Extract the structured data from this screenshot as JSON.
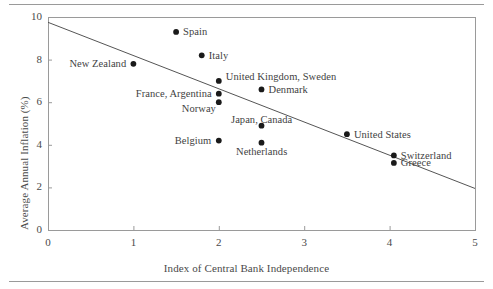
{
  "chart_data": {
    "type": "scatter",
    "title": "",
    "xlabel": "Index of Central Bank Independence",
    "ylabel": "Average Annual Inflation (%)",
    "xlim": [
      0,
      5
    ],
    "ylim": [
      0,
      10
    ],
    "xticks": [
      "0",
      "1",
      "2",
      "3",
      "4",
      "5"
    ],
    "yticks": [
      "0",
      "2",
      "4",
      "6",
      "8",
      "10"
    ],
    "grid": false,
    "legend": "none",
    "marker_color": "#1a1a1a",
    "line_color": "#555555",
    "frame_color": "#9a9a9a",
    "points": [
      {
        "label": "New Zealand",
        "x": 1.0,
        "y": 7.8,
        "label_side": "left"
      },
      {
        "label": "Spain",
        "x": 1.5,
        "y": 9.3,
        "label_side": "right"
      },
      {
        "label": "Italy",
        "x": 1.8,
        "y": 8.2,
        "label_side": "right"
      },
      {
        "label": "United Kingdom, Sweden",
        "x": 2.0,
        "y": 7.0,
        "label_side": "above-right"
      },
      {
        "label": "France, Argentina",
        "x": 2.0,
        "y": 6.4,
        "label_side": "left"
      },
      {
        "label": "Norway",
        "x": 2.0,
        "y": 6.0,
        "label_side": "below-left"
      },
      {
        "label": "Denmark",
        "x": 2.5,
        "y": 6.6,
        "label_side": "right"
      },
      {
        "label": "Belgium",
        "x": 2.0,
        "y": 4.2,
        "label_side": "left"
      },
      {
        "label": "Japan, Canada",
        "x": 2.5,
        "y": 4.9,
        "label_side": "above"
      },
      {
        "label": "Netherlands",
        "x": 2.5,
        "y": 4.1,
        "label_side": "below"
      },
      {
        "label": "United States",
        "x": 3.5,
        "y": 4.5,
        "label_side": "right"
      },
      {
        "label": "Switzerland",
        "x": 4.05,
        "y": 3.5,
        "label_side": "right"
      },
      {
        "label": "Greece",
        "x": 4.05,
        "y": 3.15,
        "label_side": "right"
      }
    ],
    "trendline": {
      "x_start": 0.0,
      "y_start": 9.75,
      "x_end": 5.0,
      "y_end": 1.95
    }
  }
}
